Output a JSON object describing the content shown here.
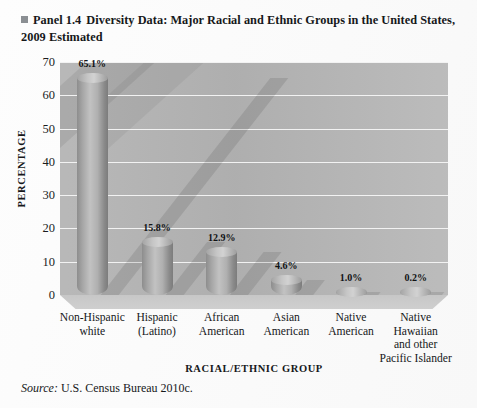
{
  "panel": {
    "bullet_icon": "square-bullet-icon",
    "label": "Panel 1.4",
    "title": "Diversity Data: Major Racial and Ethnic Groups in the United States, 2009 Estimated"
  },
  "source": {
    "label": "Source:",
    "text": "U.S. Census Bureau 2010c."
  },
  "colors": {
    "plot_background": "#b4b4b4",
    "gridline": "#f2f2f2",
    "bar_fill": "#b0b0b0",
    "bar_shadow": "#8a8a8a",
    "floor": "#c9c9c9",
    "text": "#16181a",
    "page_background": "#ffffff"
  },
  "chart_data": {
    "type": "bar",
    "title": "Diversity Data: Major Racial and Ethnic Groups in the United States, 2009 Estimated",
    "xlabel": "RACIAL/ETHNIC GROUP",
    "ylabel": "PERCENTAGE",
    "ylim": [
      0,
      70
    ],
    "yticks": [
      0,
      10,
      20,
      30,
      40,
      50,
      60,
      70
    ],
    "ytick_labels": [
      "0",
      "10",
      "20",
      "30",
      "40",
      "50",
      "60",
      "70"
    ],
    "grid": true,
    "legend": false,
    "legend_position": "none",
    "style": "3d-cylinder",
    "categories": [
      "Non-Hispanic white",
      "Hispanic (Latino)",
      "African American",
      "Asian American",
      "Native American",
      "Native Hawaiian and other Pacific Islander"
    ],
    "category_lines": [
      [
        "Non-Hispanic",
        "white"
      ],
      [
        "Hispanic",
        "(Latino)"
      ],
      [
        "African",
        "American"
      ],
      [
        "Asian",
        "American"
      ],
      [
        "Native",
        "American"
      ],
      [
        "Native",
        "Hawaiian",
        "and other",
        "Pacific Islander"
      ]
    ],
    "values": [
      65.1,
      15.8,
      12.9,
      4.6,
      1.0,
      0.2
    ],
    "data_labels": [
      "65.1%",
      "15.8%",
      "12.9%",
      "4.6%",
      "1.0%",
      "0.2%"
    ]
  }
}
